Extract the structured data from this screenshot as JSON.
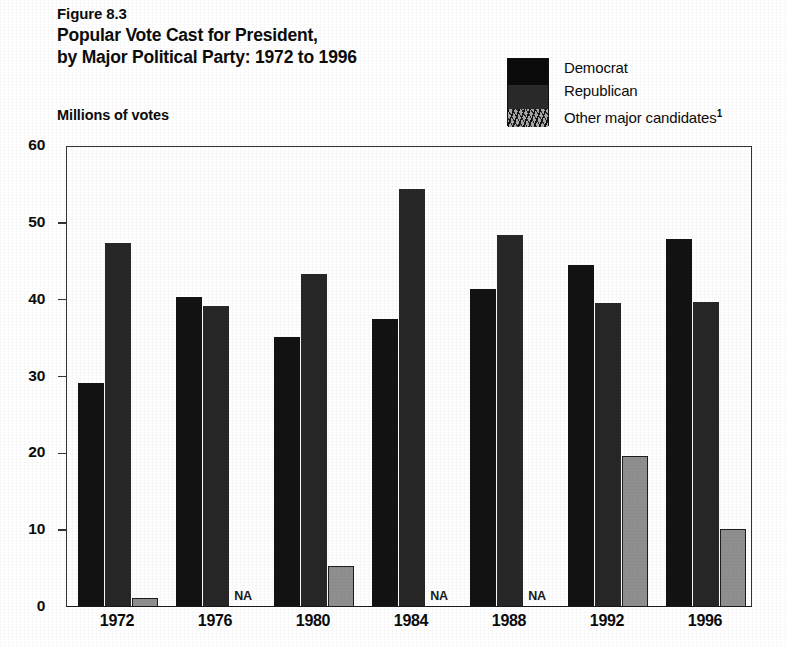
{
  "figure_label": "Figure 8.3",
  "title_lines": [
    "Popular Vote Cast for President,",
    "by Major Political Party:  1972 to 1996"
  ],
  "axis_unit_label": "Millions of votes",
  "legend": {
    "items": [
      {
        "label": "Democrat",
        "color": "#131313"
      },
      {
        "label": "Republican",
        "color": "#272727"
      },
      {
        "label": "Other major candidates",
        "color": "#8f8f8f",
        "footnote": "1"
      }
    ]
  },
  "na_text": "NA",
  "chart_data": {
    "type": "bar",
    "title": "Popular Vote Cast for President, by Major Political Party: 1972 to 1996",
    "xlabel": "",
    "ylabel": "Millions of votes",
    "ylim": [
      0,
      60
    ],
    "yticks": [
      0,
      10,
      20,
      30,
      40,
      50,
      60
    ],
    "grid": false,
    "legend_position": "top-right",
    "categories": [
      "1972",
      "1976",
      "1980",
      "1984",
      "1988",
      "1992",
      "1996"
    ],
    "series": [
      {
        "name": "Democrat",
        "values": [
          29.0,
          40.2,
          35.0,
          37.3,
          41.2,
          44.4,
          47.8
        ]
      },
      {
        "name": "Republican",
        "values": [
          47.2,
          39.0,
          43.2,
          54.3,
          48.3,
          39.4,
          39.6
        ]
      },
      {
        "name": "Other major candidates",
        "values": [
          1.0,
          null,
          5.2,
          null,
          null,
          19.5,
          10.0
        ]
      }
    ]
  }
}
